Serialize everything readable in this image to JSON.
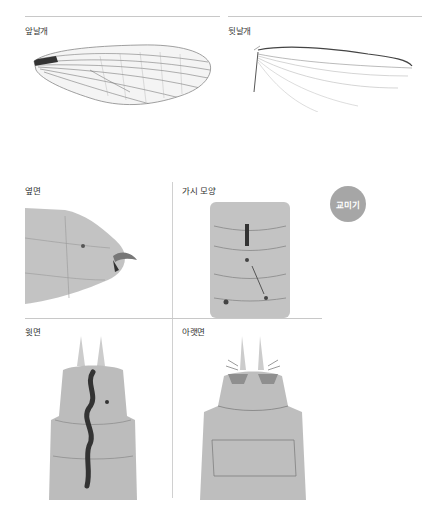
{
  "wings": {
    "forewing": {
      "label": "앞날개",
      "icon": "forewing-image"
    },
    "hindwing": {
      "label": "뒷날개",
      "icon": "hindwing-image"
    }
  },
  "views": [
    {
      "id": "side",
      "label": "옆면",
      "icon": "abdomen-side-view-image"
    },
    {
      "id": "spine",
      "label": "가시 모양",
      "icon": "spine-shape-image"
    },
    {
      "id": "dorsal",
      "label": "윗면",
      "icon": "abdomen-dorsal-view-image"
    },
    {
      "id": "ventral",
      "label": "아랫면",
      "icon": "abdomen-ventral-view-image"
    }
  ],
  "badge": {
    "label": "교미기",
    "color": "#a6a6a6"
  },
  "colors": {
    "divider": "#c8c8c8",
    "text": "#333333"
  }
}
